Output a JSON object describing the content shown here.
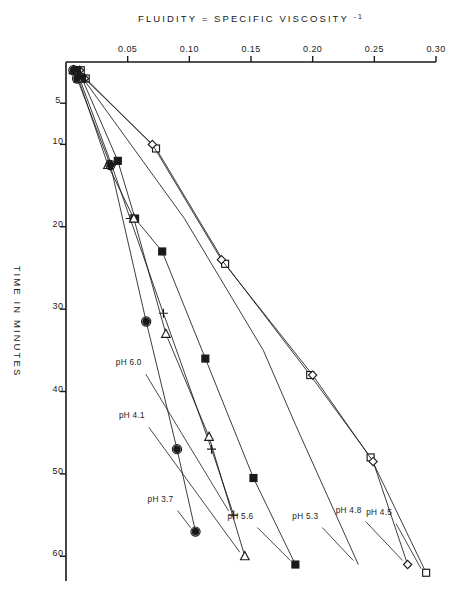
{
  "figure": {
    "orientation_degrees": 90,
    "background_color": "#ffffff",
    "ink_color": "#1a1a1a"
  },
  "chart_data": {
    "type": "line",
    "title": "",
    "subtitle": "",
    "xlabel": "TIME IN MINUTES",
    "ylabel": "FLUIDITY = SPECIFIC VISCOSITY",
    "ylabel_superscript": "-1",
    "xlim": [
      0,
      63
    ],
    "ylim": [
      0,
      0.3
    ],
    "xticks": [
      5,
      10,
      20,
      30,
      40,
      50,
      60
    ],
    "xtick_labels": [
      "5",
      "10",
      "20",
      "30",
      "40",
      "50",
      "60"
    ],
    "yticks": [
      0.05,
      0.1,
      0.15,
      0.2,
      0.25,
      0.3
    ],
    "ytick_labels": [
      "0.05",
      "0.10",
      "0.15",
      "0.20",
      "0.25",
      "0.30"
    ],
    "grid": false,
    "legend_position": "inline-end-labels",
    "series": [
      {
        "name": "pH 4.5",
        "label": "pH 4.5",
        "marker": "open-square",
        "x": [
          1,
          2,
          10.5,
          24.5,
          38,
          48,
          62
        ],
        "y": [
          0.012,
          0.016,
          0.073,
          0.129,
          0.198,
          0.247,
          0.292
        ]
      },
      {
        "name": "pH 4.8",
        "label": "pH 4.8",
        "marker": "open-diamond",
        "x": [
          1,
          2,
          10,
          24,
          38,
          48.5,
          61
        ],
        "y": [
          0.011,
          0.015,
          0.07,
          0.126,
          0.2,
          0.249,
          0.277
        ]
      },
      {
        "name": "pH 5.3",
        "label": "pH 5.3",
        "marker": "none",
        "x": [
          1,
          19,
          35,
          44,
          61
        ],
        "y": [
          0.009,
          0.096,
          0.16,
          0.186,
          0.237
        ]
      },
      {
        "name": "pH 5.6",
        "label": "pH 5.6",
        "marker": "filled-square",
        "x": [
          1,
          2,
          12,
          19,
          23,
          36,
          50.5,
          61
        ],
        "y": [
          0.009,
          0.013,
          0.042,
          0.056,
          0.078,
          0.113,
          0.152,
          0.186
        ]
      },
      {
        "name": "pH 6.0",
        "label": "pH 6.0",
        "marker": "plus",
        "x": [
          1,
          2,
          12.5,
          19,
          30.5,
          47,
          55
        ],
        "y": [
          0.008,
          0.011,
          0.037,
          0.052,
          0.079,
          0.118,
          0.136
        ]
      },
      {
        "name": "pH 4.1",
        "label": "pH 4.1",
        "marker": "open-triangle-left",
        "x": [
          1,
          2,
          12.5,
          19,
          33,
          45.5,
          60
        ],
        "y": [
          0.006,
          0.01,
          0.034,
          0.055,
          0.081,
          0.116,
          0.145
        ]
      },
      {
        "name": "pH 3.7",
        "label": "pH 3.7",
        "marker": "filled-circle",
        "x": [
          1,
          2,
          12.5,
          31.5,
          47,
          57
        ],
        "y": [
          0.006,
          0.009,
          0.036,
          0.065,
          0.09,
          0.105
        ]
      }
    ]
  }
}
